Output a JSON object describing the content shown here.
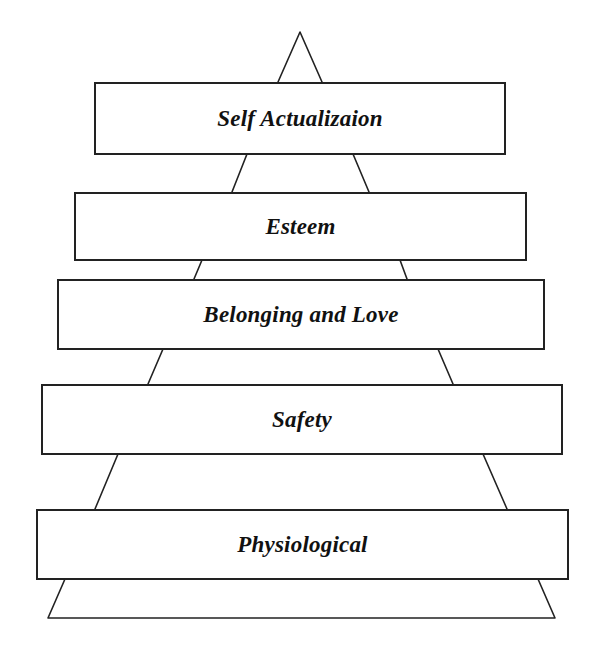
{
  "diagram": {
    "type": "hierarchy-pyramid",
    "line_color": "#222222",
    "levels": [
      {
        "label": "Self Actualizaion",
        "order": 1
      },
      {
        "label": "Esteem",
        "order": 2
      },
      {
        "label": "Belonging and Love",
        "order": 3
      },
      {
        "label": "Safety",
        "order": 4
      },
      {
        "label": "Physiological",
        "order": 5
      }
    ]
  }
}
